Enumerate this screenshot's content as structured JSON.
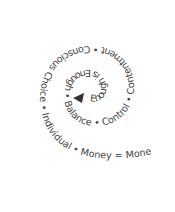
{
  "diagram": {
    "type": "spiral-text",
    "center_marker": "▲",
    "phrases": [
      "Enough is Enough",
      "Balance",
      "Control",
      "Contentment",
      "Conscious Choice",
      "Individual",
      "Money = Money and Food = Food"
    ],
    "separator": " • ",
    "full_text": "Enough is Enough • Balance • Control • Contentment • Conscious Choice • Individual • Money = Money and Food = Food",
    "text_color": "#444444",
    "background": "#ffffff"
  }
}
